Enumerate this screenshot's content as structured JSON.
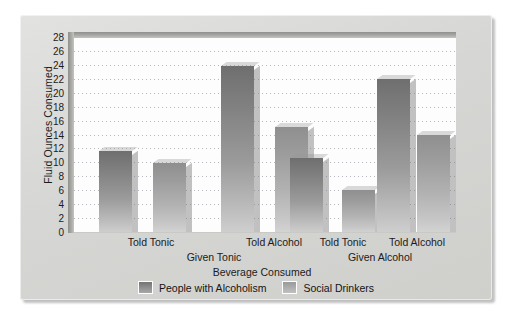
{
  "chart_data": {
    "type": "bar",
    "title": "",
    "xlabel": "Beverage Consumed",
    "ylabel": "Fluid Ounces Consumed",
    "ylim": [
      0,
      28
    ],
    "ytick_step": 2,
    "yticks": [
      28,
      26,
      24,
      22,
      20,
      18,
      16,
      14,
      12,
      10,
      8,
      6,
      4,
      2,
      0
    ],
    "grid": "horizontal-dotted",
    "legend_position": "bottom-center",
    "groups": [
      "Given Tonic",
      "Given Alcohol"
    ],
    "categories": [
      "Told Tonic",
      "Told Alcohol",
      "Told Tonic",
      "Told Alcohol"
    ],
    "series": [
      {
        "name": "People with Alcoholism",
        "color": "#7f7f7f",
        "values": [
          11.8,
          24.0,
          10.7,
          22.1
        ]
      },
      {
        "name": "Social Drinkers",
        "color": "#a8a8a8",
        "values": [
          10.0,
          15.2,
          6.2,
          14.1
        ]
      }
    ],
    "bars": [
      {
        "group": "Given Tonic",
        "category": "Told Tonic",
        "series": "People with Alcoholism",
        "value": 11.8
      },
      {
        "group": "Given Tonic",
        "category": "Told Tonic",
        "series": "Social Drinkers",
        "value": 10.0
      },
      {
        "group": "Given Tonic",
        "category": "Told Alcohol",
        "series": "People with Alcoholism",
        "value": 24.0
      },
      {
        "group": "Given Tonic",
        "category": "Told Alcohol",
        "series": "Social Drinkers",
        "value": 15.2
      },
      {
        "group": "Given Alcohol",
        "category": "Told Tonic",
        "series": "People with Alcoholism",
        "value": 10.7
      },
      {
        "group": "Given Alcohol",
        "category": "Told Tonic",
        "series": "Social Drinkers",
        "value": 6.2
      },
      {
        "group": "Given Alcohol",
        "category": "Told Alcohol",
        "series": "People with Alcoholism",
        "value": 22.1
      },
      {
        "group": "Given Alcohol",
        "category": "Told Alcohol",
        "series": "Social Drinkers",
        "value": 14.1
      }
    ]
  },
  "axis": {
    "y_title": "Fluid Ounces Consumed",
    "x_title": "Beverage Consumed",
    "y_ticks": [
      "28",
      "26",
      "24",
      "22",
      "20",
      "18",
      "16",
      "14",
      "12",
      "10",
      "8",
      "6",
      "4",
      "2",
      "0"
    ],
    "x_tick_labels": [
      "Told Tonic",
      "Told Alcohol",
      "Told Tonic",
      "Told Alcohol"
    ],
    "x_group_labels": [
      "Given Tonic",
      "Given Alcohol"
    ]
  },
  "legend": {
    "items": [
      {
        "label": "People with Alcoholism",
        "swatch": "dark"
      },
      {
        "label": "Social Drinkers",
        "swatch": "light"
      }
    ]
  },
  "colors": {
    "card_background": "#d9d9d7",
    "plot_background": "#fdfdfd",
    "gridline": "#b9b6bd",
    "frame": "#9a9a97",
    "text": "#1b1b1b",
    "bar_dark": "#7f7f7f",
    "bar_light": "#a8a8a8"
  }
}
